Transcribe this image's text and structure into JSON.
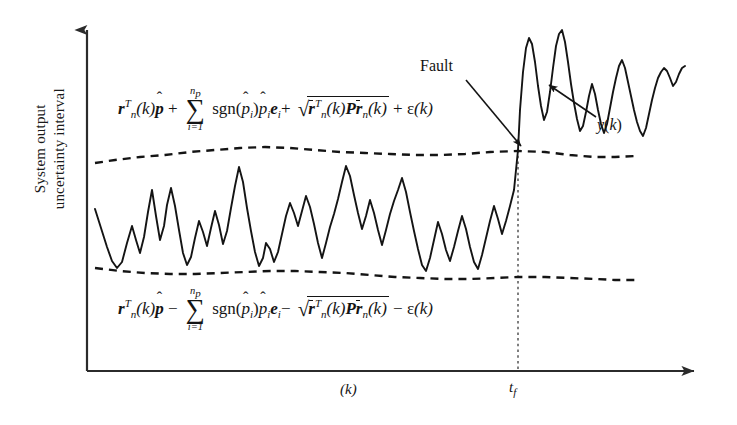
{
  "figure": {
    "type": "signal-envelope-fault-detection-diagram",
    "background_color": "#ffffff",
    "line_color": "#141414"
  },
  "axes": {
    "y_label_line1": "System output",
    "y_label_line2": "uncertainty interval",
    "x_label": "(k)",
    "fault_time_tick": "t",
    "fault_time_tick_sub": "f",
    "y_axis_arrow": "up-arrow-icon",
    "x_axis_arrow": "right-arrow-icon",
    "origin_x": 87,
    "origin_y": 371,
    "x_axis_end": 706,
    "y_axis_top": 22
  },
  "annotations": {
    "fault_label": "Fault",
    "signal_label_y": "y",
    "signal_label_paren_open": "(",
    "signal_label_k": "k",
    "signal_label_paren_close": ")",
    "fault_arrow": "arrow-to-fault-point",
    "signal_arrow": "arrow-to-signal-curve",
    "fault_line_style": "dotted-vertical"
  },
  "formula_upper": {
    "id": "upper-uncertainty-bound",
    "r": "r",
    "r_sup_T": "T",
    "r_sub_n": "n",
    "of_k": "(k)",
    "p_hat": "p",
    "hat": "ˆ",
    "plus": "+",
    "sum_symbol": "∑",
    "sum_upper": "n",
    "sum_upper_sub": "p",
    "sum_lower": "i=1",
    "sgn": "sgn",
    "sgn_arg_open": "(",
    "sgn_arg_p": "p",
    "sgn_arg_sub_i": "i",
    "sgn_arg_close": ")",
    "p_hat_i": "p",
    "p_hat_i_sub": "i",
    "e_i": "e",
    "e_i_sub": "i",
    "sqrt_symbol": "√",
    "sqrt_rbar": "r",
    "sqrt_rbar_sup_T": "T",
    "sqrt_rbar_sub_n": "n",
    "sqrt_of_k": "(k)",
    "sqrt_P": "P",
    "sqrt_rbar2": "r",
    "sqrt_rbar2_sub_n": "n",
    "sqrt_of_k2": "(k)",
    "epsilon": "ε",
    "epsilon_of_k": "(k)"
  },
  "formula_lower": {
    "id": "lower-uncertainty-bound",
    "r": "r",
    "r_sup_T": "T",
    "r_sub_n": "n",
    "of_k": "(k)",
    "p_hat": "p",
    "hat": "ˆ",
    "minus": "−",
    "sum_symbol": "∑",
    "sum_upper": "n",
    "sum_upper_sub": "p",
    "sum_lower": "i=1",
    "sgn": "sgn",
    "sgn_arg_open": "(",
    "sgn_arg_p": "p",
    "sgn_arg_sub_i": "i",
    "sgn_arg_close": ")",
    "p_hat_i": "p",
    "p_hat_i_sub": "i",
    "e_i": "e",
    "e_i_sub": "i",
    "sqrt_symbol": "√",
    "sqrt_rbar": "r",
    "sqrt_rbar_sup_T": "T",
    "sqrt_rbar_sub_n": "n",
    "sqrt_of_k": "(k)",
    "sqrt_P": "P",
    "sqrt_rbar2": "r",
    "sqrt_rbar2_sub_n": "n",
    "sqrt_of_k2": "(k)",
    "epsilon": "ε",
    "epsilon_of_k": "(k)"
  },
  "chart_data": {
    "type": "line",
    "title": "",
    "xlabel": "(k)",
    "ylabel": "System output uncertainty interval",
    "grid": false,
    "legend": false,
    "fault_time_x": 518,
    "series": [
      {
        "name": "upper-envelope",
        "style": "dashed",
        "points": "95,163 115,160 140,157 165,155 190,152 215,150 240,148 265,147 290,148 315,150 340,152 365,153 390,154 415,155 440,155 465,154 490,152 518,151 545,152 570,155 595,157 615,157 635,156"
      },
      {
        "name": "lower-envelope",
        "style": "dashed",
        "points": "95,268 120,271 145,273 170,274 195,274 220,273 245,272 270,271 295,271 320,272 345,273 370,275 395,277 420,278 445,279 470,279 495,278 518,277 545,277 570,278 595,279 615,280 635,280"
      },
      {
        "name": "y(k)",
        "style": "solid",
        "description": "system output signal oscillating within bounds pre-fault, jumping above upper envelope after fault at t_f",
        "points": "95,209 101,228 107,247 112,261 117,268 122,262 127,243 132,226 136,240 140,253 144,237 148,212 152,190 156,216 160,240 164,226 167,205 171,188 175,206 179,230 183,253 187,265 191,257 195,238 199,221 203,232 207,246 211,228 215,211 219,225 223,244 227,231 231,208 235,186 239,167 243,182 247,208 251,231 255,252 259,266 263,258 266,243 270,249 274,262 278,252 282,234 286,216 290,203 294,213 298,226 302,211 306,196 310,207 314,224 318,243 322,258 326,243 330,227 334,214 338,199 342,182 346,166 350,176 354,195 358,213 362,229 366,216 370,200 374,213 378,230 382,245 386,230 390,214 394,201 398,190 402,178 406,192 410,212 414,231 418,249 422,265 426,271 430,258 434,240 438,222 442,234 446,250 450,261 454,247 458,231 462,216 466,229 470,247 474,262 478,269 482,255 486,238 490,221 494,206 498,219 502,234 506,221 510,206 514,190 518,150 520,110 523,72 526,48 529,38 532,44 535,62 538,86 541,106 544,120 547,112 550,92 553,68 556,46 559,34 562,30 565,42 568,62 571,84 574,103 577,119 580,131 583,126 586,112 589,96 592,84 595,94 598,110 601,124 604,133 607,124 610,108 613,92 616,78 619,66 622,60 625,68 628,82 631,96 634,110 637,122 640,131 643,136 646,128 649,114 652,100 655,88 658,78 661,72 664,68 667,71 670,78 673,86 676,82 679,74 682,68 685,66"
      }
    ]
  }
}
